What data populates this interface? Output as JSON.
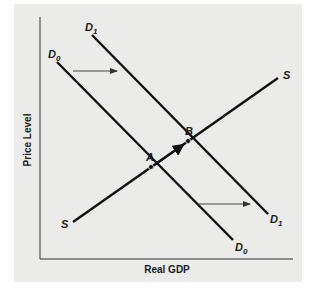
{
  "diagram": {
    "axes": {
      "x_label": "Real GDP",
      "y_label": "Price Level"
    },
    "curves": [
      {
        "id": "D0",
        "label": "D",
        "subscript": "0",
        "type": "demand"
      },
      {
        "id": "D1",
        "label": "D",
        "subscript": "1",
        "type": "demand"
      },
      {
        "id": "S",
        "label": "S",
        "type": "supply"
      }
    ],
    "points": [
      {
        "id": "A",
        "label": "A"
      },
      {
        "id": "B",
        "label": "B"
      }
    ],
    "colors": {
      "line": "#111111",
      "background": "#ebebea",
      "arrow": "#333333"
    }
  }
}
